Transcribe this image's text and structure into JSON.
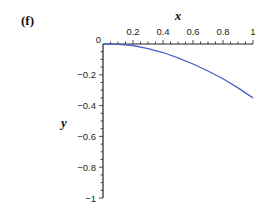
{
  "panel_label": "(f)",
  "chart_data": {
    "type": "line",
    "title": "",
    "xlabel": "x",
    "ylabel": "y",
    "xlim": [
      0,
      1
    ],
    "ylim": [
      -1,
      0
    ],
    "x_ticks": [
      "0.2",
      "0.4",
      "0.6",
      "0.8",
      "1"
    ],
    "y_ticks": [
      "0",
      "-0.2",
      "-0.4",
      "-0.6",
      "-0.8",
      "-1"
    ],
    "x_axis_position": "top",
    "grid": false,
    "legend": null,
    "series": [
      {
        "name": "y(x)",
        "color": "#4a5fc1",
        "x": [
          0,
          0.1,
          0.2,
          0.3,
          0.4,
          0.5,
          0.6,
          0.7,
          0.8,
          0.9,
          1.0
        ],
        "y": [
          0,
          -0.002,
          -0.01,
          -0.03,
          -0.055,
          -0.09,
          -0.13,
          -0.175,
          -0.225,
          -0.285,
          -0.35
        ]
      }
    ]
  }
}
